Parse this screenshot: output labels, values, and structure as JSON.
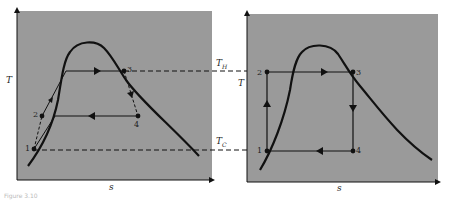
{
  "figure": {
    "caption_fragment": "Figure 3.10",
    "left_panel": {
      "title": "Real vapor-compression cycle on T-s diagram",
      "x_axis_label": "s",
      "y_axis_label": "T",
      "points": [
        "1",
        "2",
        "3",
        "4"
      ]
    },
    "right_panel": {
      "title": "Ideal Carnot cycle on T-s diagram",
      "x_axis_label": "s",
      "y_axis_label": "T",
      "points": [
        "1",
        "2",
        "3",
        "4"
      ]
    },
    "reference_lines": {
      "hot": "T",
      "hot_sub": "H",
      "cold": "T",
      "cold_sub": "C"
    },
    "colors": {
      "panel_bg": "#9a9a9a",
      "line": "#111111",
      "page_bg": "#ffffff"
    }
  }
}
